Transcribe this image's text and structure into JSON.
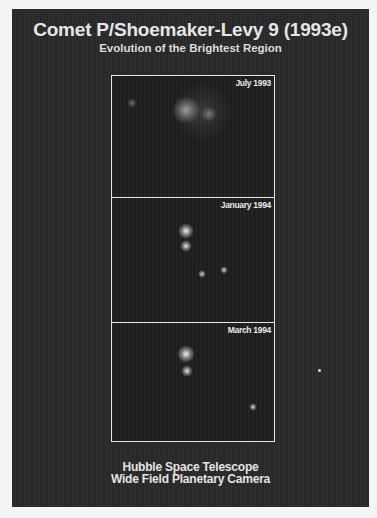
{
  "header": {
    "title": "Comet P/Shoemaker-Levy 9 (1993e)",
    "subtitle": "Evolution of the Brightest Region"
  },
  "panels": [
    {
      "label": "July 1993",
      "blobs": [
        {
          "x": 20,
          "y": 27,
          "r": 5,
          "brightness": 0.35
        },
        {
          "x": 74,
          "y": 34,
          "r": 14,
          "brightness": 0.55
        },
        {
          "x": 97,
          "y": 38,
          "r": 8,
          "brightness": 0.35
        },
        {
          "x": 90,
          "y": 36,
          "r": 30,
          "brightness": 0.12
        }
      ]
    },
    {
      "label": "January 1994",
      "blobs": [
        {
          "x": 74,
          "y": 33,
          "r": 8,
          "brightness": 0.95
        },
        {
          "x": 74,
          "y": 48,
          "r": 6,
          "brightness": 0.9
        },
        {
          "x": 90,
          "y": 76,
          "r": 4,
          "brightness": 0.85
        },
        {
          "x": 112,
          "y": 72,
          "r": 4,
          "brightness": 0.85
        }
      ]
    },
    {
      "label": "March 1994",
      "blobs": [
        {
          "x": 74,
          "y": 31,
          "r": 9,
          "brightness": 0.95
        },
        {
          "x": 75,
          "y": 48,
          "r": 6,
          "brightness": 0.9
        },
        {
          "x": 141,
          "y": 84,
          "r": 4,
          "brightness": 0.85
        }
      ]
    }
  ],
  "footer": {
    "line1": "Hubble Space Telescope",
    "line2": "Wide Field Planetary Camera"
  }
}
